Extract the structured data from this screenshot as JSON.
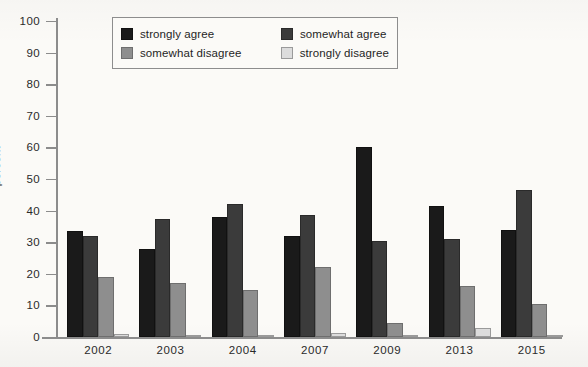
{
  "axes": {
    "ylabel": "percent",
    "yticks": [
      "100",
      "90",
      "80",
      "70",
      "60",
      "50",
      "40",
      "30",
      "20",
      "10",
      "0"
    ],
    "ylim": [
      0,
      100
    ],
    "xlabel": ""
  },
  "legend": {
    "position": "top-center",
    "entries": [
      {
        "label": "strongly agree",
        "color": "#1a1a1a"
      },
      {
        "label": "somewhat agree",
        "color": "#3b3b3b"
      },
      {
        "label": "somewhat disagree",
        "color": "#8e8e8e"
      },
      {
        "label": "strongly disagree",
        "color": "#dcdcdc"
      }
    ]
  },
  "chart_data": {
    "type": "bar",
    "title": "",
    "xlabel": "",
    "ylabel": "percent",
    "ylim": [
      0,
      100
    ],
    "grid": false,
    "legend_position": "top-center",
    "categories": [
      "2002",
      "2003",
      "2004",
      "2007",
      "2009",
      "2013",
      "2015"
    ],
    "series": [
      {
        "name": "strongly agree",
        "color": "#1a1a1a",
        "values": [
          33.5,
          28.0,
          38.0,
          32.0,
          60.0,
          41.5,
          34.0
        ]
      },
      {
        "name": "somewhat agree",
        "color": "#3b3b3b",
        "values": [
          32.0,
          37.5,
          42.0,
          38.5,
          30.5,
          31.0,
          46.5
        ]
      },
      {
        "name": "somewhat disagree",
        "color": "#8e8e8e",
        "values": [
          19.0,
          17.0,
          15.0,
          22.0,
          4.5,
          16.0,
          10.5
        ]
      },
      {
        "name": "strongly disagree",
        "color": "#dcdcdc",
        "values": [
          1.0,
          0.7,
          0.5,
          1.2,
          0.6,
          2.7,
          0.5
        ]
      }
    ]
  }
}
